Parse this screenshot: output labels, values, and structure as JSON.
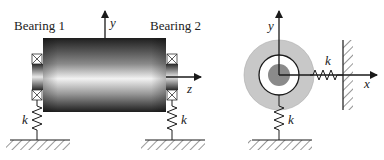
{
  "figure": {
    "left_panel": {
      "title": "Rotor side view",
      "bearing_labels": [
        "Bearing 1",
        "Bearing 2"
      ],
      "axes": {
        "vertical": "y",
        "horizontal": "z"
      },
      "spring_labels": [
        "k",
        "k"
      ]
    },
    "right_panel": {
      "title": "Rotor cross-section",
      "axes": {
        "vertical": "y",
        "horizontal": "x"
      },
      "spring_labels": [
        "k",
        "k"
      ]
    },
    "colors": {
      "outer_disk": "#c8c8c8",
      "inner_core": "#8a8a8a",
      "ring_fill": "#ffffff",
      "line": "#1a1a1a",
      "rotor_dark": "#1e1e1e",
      "rotor_light": "#f2f2f2"
    }
  }
}
